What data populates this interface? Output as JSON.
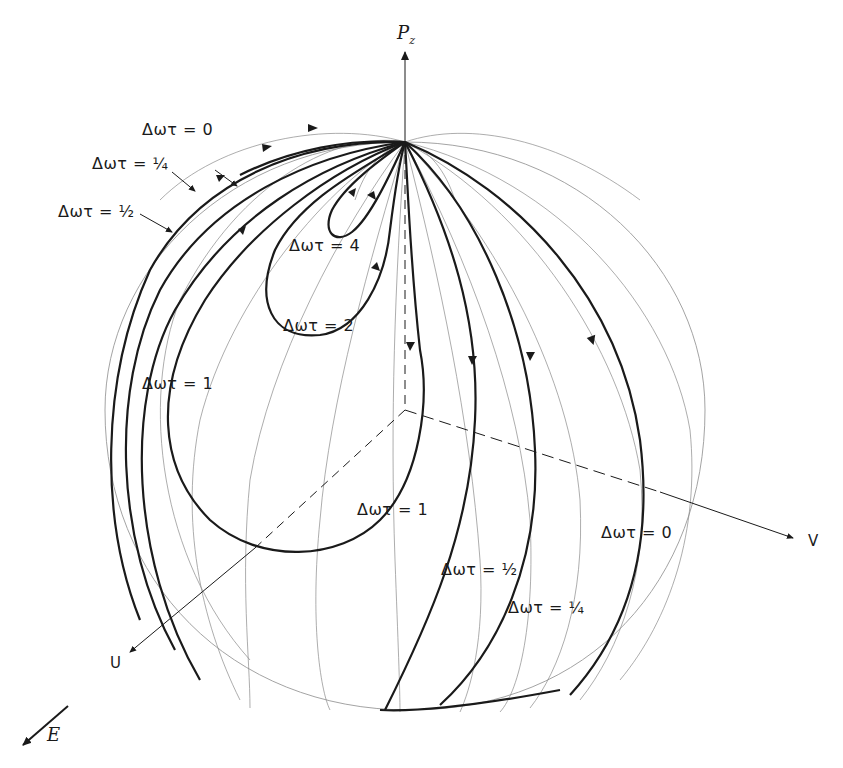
{
  "figure": {
    "type": "Bloch sphere trajectories",
    "axes": {
      "z": {
        "label": "P",
        "subscript": "z"
      },
      "u": {
        "label": "U"
      },
      "v": {
        "label": "V"
      },
      "field": {
        "label": "E"
      }
    },
    "curve_labels": [
      {
        "id": "top-0",
        "text": "Δωτ = 0"
      },
      {
        "id": "top-quarter",
        "text": "Δωτ = ¼"
      },
      {
        "id": "top-half",
        "text": "Δωτ = ½"
      },
      {
        "id": "four",
        "text": "Δωτ = 4"
      },
      {
        "id": "two",
        "text": "Δωτ = 2"
      },
      {
        "id": "one-left",
        "text": "Δωτ = 1"
      },
      {
        "id": "one-bottom",
        "text": "Δωτ = 1"
      },
      {
        "id": "half-bottom",
        "text": "Δωτ = ½"
      },
      {
        "id": "quarter-bottom",
        "text": "Δωτ = ¼"
      },
      {
        "id": "zero-right",
        "text": "Δωτ = 0"
      }
    ],
    "colors": {
      "ink": "#1a1a1a",
      "grid": "#888888",
      "background": "#ffffff"
    }
  }
}
